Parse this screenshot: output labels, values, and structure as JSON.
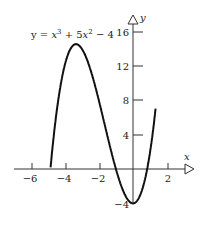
{
  "chart_data": {
    "type": "line",
    "equation": {
      "prefix": "y = ",
      "t1": "x",
      "e1": "3",
      "t2": " + 5",
      "t3": "x",
      "e2": "2",
      "t4": " − 4"
    },
    "xlabel": "x",
    "ylabel": "y",
    "xlim": [
      -6.5,
      2.5
    ],
    "ylim": [
      -4.5,
      18
    ],
    "grid": false,
    "legend": "none",
    "x_ticks": [
      -6,
      -4,
      -2,
      2
    ],
    "x_tick_labels": [
      "−6",
      "−4",
      "−2",
      "2"
    ],
    "y_ticks": [
      16,
      12,
      8,
      4,
      -4
    ],
    "y_tick_labels": [
      "16",
      "12",
      "8",
      "4",
      "−4"
    ],
    "series": [
      {
        "name": "y = x^3 + 5x^2 - 4",
        "x": [
          -4.8,
          -4.5,
          -4,
          -3.5,
          -3.33,
          -3,
          -2.5,
          -2,
          -1.5,
          -1,
          -0.5,
          0,
          0.5,
          1,
          1.3
        ],
        "y": [
          -0.9,
          2.1,
          12,
          14.4,
          14.5,
          14,
          12.6,
          8,
          4.9,
          0,
          -2.9,
          -4,
          -2.6,
          2,
          5.6
        ]
      }
    ]
  },
  "labels": {
    "x_axis": "x",
    "y_axis": "y",
    "ticks_x": [
      "−6",
      "−4",
      "−2",
      "2"
    ],
    "ticks_y": [
      "16",
      "12",
      "8",
      "4",
      "−4"
    ]
  }
}
